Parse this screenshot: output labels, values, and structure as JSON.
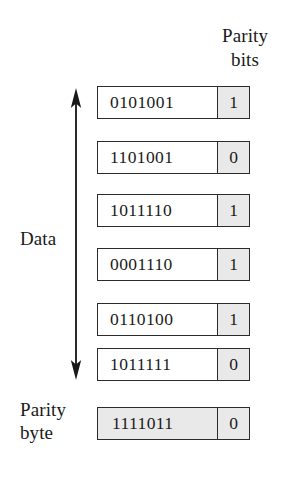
{
  "figure": {
    "title_column_header": {
      "line1": "Parity",
      "line2": "bits"
    },
    "data_label": "Data",
    "parity_byte_label": {
      "line1": "Parity",
      "line2": "byte"
    },
    "arrow_name": "data-direction-double-arrow",
    "colors": {
      "shaded_cell": "#e9e9e9",
      "border": "#2b2b2b",
      "background": "#ffffff",
      "text": "#1a1a1a"
    },
    "data_rows": [
      {
        "data_bits": "0101001",
        "parity_bit": "1"
      },
      {
        "data_bits": "1101001",
        "parity_bit": "0"
      },
      {
        "data_bits": "1011110",
        "parity_bit": "1"
      },
      {
        "data_bits": "0001110",
        "parity_bit": "1"
      },
      {
        "data_bits": "0110100",
        "parity_bit": "1"
      },
      {
        "data_bits": "1011111",
        "parity_bit": "0"
      }
    ],
    "parity_byte_row": {
      "data_bits": "1111011",
      "parity_bit": "0"
    }
  }
}
